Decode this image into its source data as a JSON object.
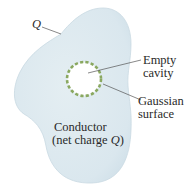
{
  "figure": {
    "conductor_label": {
      "line1": "Conductor",
      "line2_prefix": "(net charge ",
      "line2_var": "Q",
      "line2_suffix": ")"
    },
    "surface_charge_label": "Q",
    "cavity_label": {
      "line1": "Empty",
      "line2": "cavity"
    },
    "gaussian_label": {
      "line1": "Gaussian",
      "line2": "surface"
    }
  },
  "colors": {
    "conductor_fill": "#dde9ef",
    "conductor_edge": "#c9d9e2",
    "cavity_fill": "#ffffff",
    "gaussian_dash": "#8aa860",
    "leader_line": "#555555",
    "text": "#2a2a2a"
  }
}
